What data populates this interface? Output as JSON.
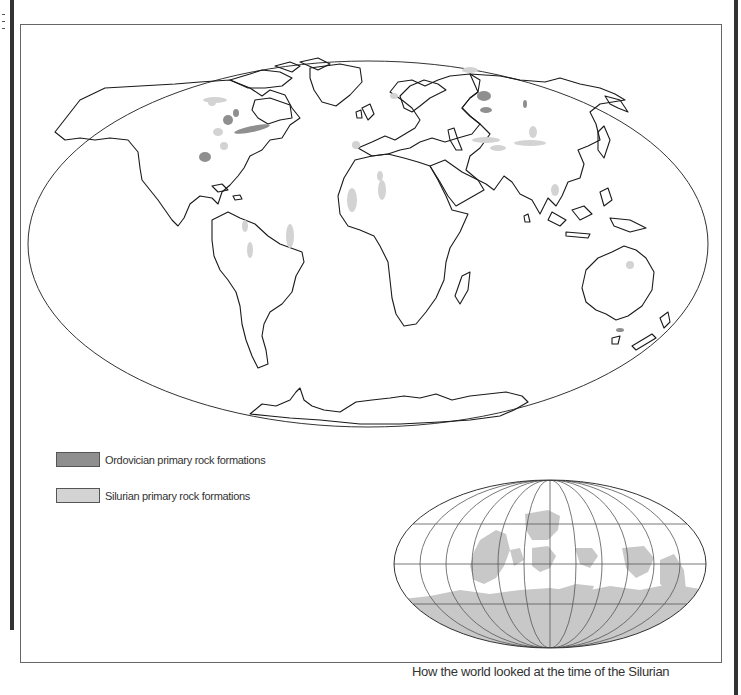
{
  "map": {
    "type": "world-map",
    "projection": "elliptical (Mollweide-like)",
    "colors": {
      "ordovician": "#8f8f8f",
      "silurian": "#d3d3d3",
      "outline": "#222222",
      "frame": "#666666",
      "bars": "#333333"
    }
  },
  "legend": {
    "items": [
      {
        "label": "Ordovician primary rock formations",
        "color": "#8f8f8f"
      },
      {
        "label": "Silurian primary rock formations",
        "color": "#d3d3d3"
      }
    ]
  },
  "inset": {
    "caption": "How the world looked at the time of the Silurian",
    "landmass_color": "#c8c8c8",
    "graticule": true
  }
}
